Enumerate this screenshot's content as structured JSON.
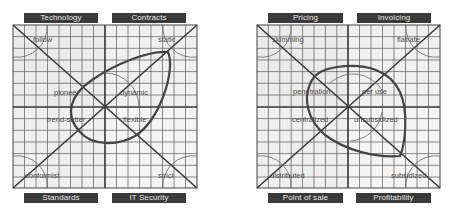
{
  "diagrams": [
    {
      "name": "left",
      "top_labels": [
        "Technology",
        "Contracts"
      ],
      "bottom_labels": [
        "Standards",
        "IT Security"
      ],
      "corner_terms": {
        "top_left": "follow",
        "top_right": "static",
        "bottom_left": "conformist",
        "bottom_right": "strict"
      },
      "inner_terms": {
        "upper_left": "pioneer",
        "upper_right": "dynamic",
        "lower_left": "trend-setter",
        "lower_right": "flexible"
      },
      "shape": "teardrop"
    },
    {
      "name": "right",
      "top_labels": [
        "Pricing",
        "Invoicing"
      ],
      "bottom_labels": [
        "Point of sale",
        "Profitability"
      ],
      "corner_terms": {
        "top_left": "skimming",
        "top_right": "flatrate",
        "bottom_left": "distributed",
        "bottom_right": "subsidized"
      },
      "inner_terms": {
        "upper_left": "penetration",
        "upper_right": "per use",
        "lower_left": "centralized",
        "lower_right": "unsubsidized"
      },
      "shape": "rounded-ellipse"
    }
  ],
  "colors": {
    "label_bg": "#3a3a3a",
    "label_text": "#e8e8e8",
    "grid": "#555555",
    "axis": "#333333",
    "shape": "#444444",
    "quadrant_shade": "#e9e9e9",
    "quadrant_light": "#f3f3f3"
  }
}
